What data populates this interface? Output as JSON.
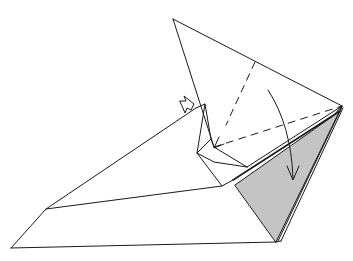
{
  "diagram": {
    "type": "origami-fold-diagram",
    "colors": {
      "line": "#1a1a1a",
      "background": "#ffffff",
      "shaded": "#c4c4c4"
    },
    "symbols": [
      {
        "name": "push-in-arrow",
        "description": "hollow push/squash arrow pointing right"
      },
      {
        "name": "valley-fold-line",
        "description": "dashed line"
      },
      {
        "name": "fold-direction-arrow",
        "description": "curved arrow pointing down"
      }
    ]
  }
}
